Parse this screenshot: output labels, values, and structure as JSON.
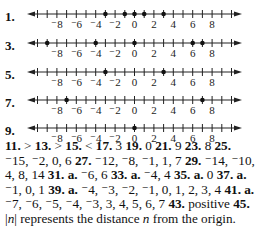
{
  "number_lines": [
    {
      "label": "1.",
      "points": [
        -3,
        -1,
        0,
        1,
        3
      ]
    },
    {
      "label": "3.",
      "points": [
        -9,
        -4,
        0,
        6,
        7
      ]
    },
    {
      "label": "5.",
      "points": [
        -3,
        3
      ]
    },
    {
      "label": "7.",
      "points": [
        -7,
        7
      ]
    },
    {
      "label": "9.",
      "points": [
        0
      ]
    }
  ],
  "axis": {
    "min": -10,
    "max": 10,
    "tick_labels": [
      {
        "v": -8,
        "t": "⁻8"
      },
      {
        "v": -6,
        "t": "⁻6"
      },
      {
        "v": -4,
        "t": "⁻4"
      },
      {
        "v": -2,
        "t": "⁻2"
      },
      {
        "v": 0,
        "t": "0"
      },
      {
        "v": 2,
        "t": "2"
      },
      {
        "v": 4,
        "t": "4"
      },
      {
        "v": 6,
        "t": "6"
      },
      {
        "v": 8,
        "t": "8"
      }
    ]
  },
  "answers": [
    {
      "n": "11.",
      "a": ">"
    },
    {
      "n": "13.",
      "a": ">"
    },
    {
      "n": "15.",
      "a": "<"
    },
    {
      "n": "17.",
      "a": "3"
    },
    {
      "n": "19.",
      "a": "0"
    },
    {
      "n": "21.",
      "a": "9"
    },
    {
      "n": "23.",
      "a": "8"
    },
    {
      "n": "25.",
      "a": "⁻15, ⁻2, 0, 6"
    },
    {
      "n": "27.",
      "a": "⁻12, ⁻8, ⁻1, 1, 7"
    },
    {
      "n": "29.",
      "a": "⁻14, ⁻10, 4, 8, 14"
    },
    {
      "n": "31.",
      "sub": "a.",
      "a": "⁻6, 6"
    },
    {
      "n": "33.",
      "sub": "a.",
      "a": "⁻4, 4"
    },
    {
      "n": "35.",
      "sub": "a.",
      "a": "0"
    },
    {
      "n": "37.",
      "sub": "a.",
      "a": "⁻1, 0, 1"
    },
    {
      "n": "39.",
      "sub": "a.",
      "a": "⁻4, ⁻3, ⁻2, ⁻1, 0, 1, 2, 3, 4"
    },
    {
      "n": "41.",
      "sub": "a.",
      "a": "⁻7, ⁻6, ⁻5, ⁻4, ⁻3, 3, 4, 5, 6, 7"
    },
    {
      "n": "43.",
      "a": "positive"
    },
    {
      "n": "45.",
      "a": "|n| represents the distance n from the origin."
    }
  ]
}
